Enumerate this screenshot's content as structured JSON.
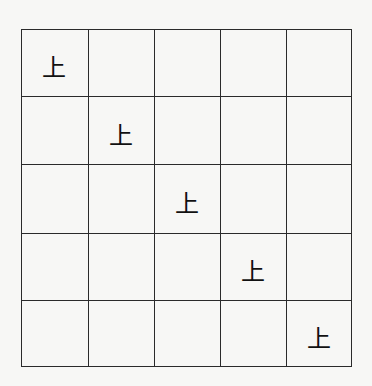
{
  "grid": {
    "rows": 5,
    "cols": 5,
    "cells": [
      [
        "上",
        "",
        "",
        "",
        ""
      ],
      [
        "",
        "上",
        "",
        "",
        ""
      ],
      [
        "",
        "",
        "上",
        "",
        ""
      ],
      [
        "",
        "",
        "",
        "上",
        ""
      ],
      [
        "",
        "",
        "",
        "",
        "上"
      ]
    ]
  }
}
